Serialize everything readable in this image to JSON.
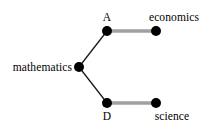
{
  "diagram": {
    "type": "graph",
    "background_color": "#ffffff",
    "width": 213,
    "height": 130,
    "node_color": "#000000",
    "node_radius": 5,
    "edge_colors": {
      "tree_edge": "#1a1a1a",
      "match_edge": "#a0a0a0"
    },
    "nodes": [
      {
        "id": "mathematics",
        "label": "mathematics",
        "x": 79,
        "y": 67,
        "label_x": 72,
        "label_y": 67,
        "label_position": "left"
      },
      {
        "id": "A",
        "label": "A",
        "x": 107,
        "y": 31,
        "label_x": 107,
        "label_y": 23,
        "label_position": "above"
      },
      {
        "id": "economics",
        "label": "economics",
        "x": 156,
        "y": 31,
        "label_x": 174,
        "label_y": 23,
        "label_position": "above"
      },
      {
        "id": "D",
        "label": "D",
        "x": 107,
        "y": 103,
        "label_x": 107,
        "label_y": 110,
        "label_position": "below"
      },
      {
        "id": "science",
        "label": "science",
        "x": 156,
        "y": 103,
        "label_x": 172,
        "label_y": 110,
        "label_position": "below"
      }
    ],
    "edges": [
      {
        "id": "edge-mathematics-a",
        "from": "mathematics",
        "to": "A",
        "style": "thin-dark",
        "color": "#1a1a1a",
        "width": 1.3
      },
      {
        "id": "edge-mathematics-d",
        "from": "mathematics",
        "to": "D",
        "style": "thin-dark",
        "color": "#1a1a1a",
        "width": 1.3
      },
      {
        "id": "edge-a-economics",
        "from": "A",
        "to": "economics",
        "style": "thick-gray",
        "color": "#a0a0a0",
        "width": 3.4
      },
      {
        "id": "edge-d-science",
        "from": "D",
        "to": "science",
        "style": "thick-gray",
        "color": "#a0a0a0",
        "width": 3.4
      }
    ]
  }
}
